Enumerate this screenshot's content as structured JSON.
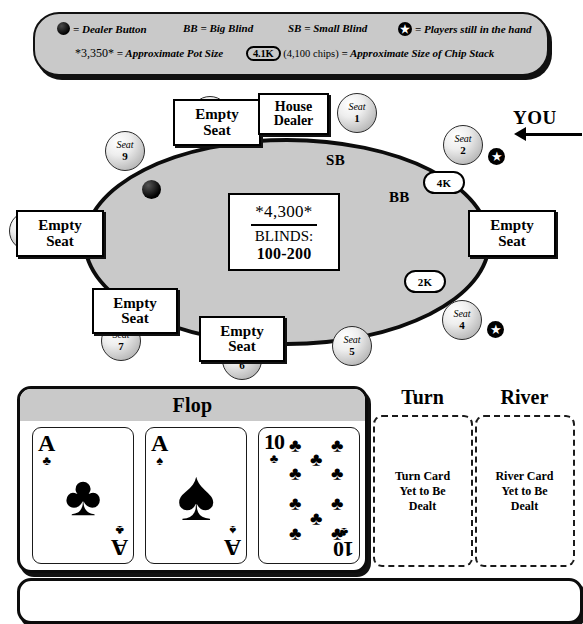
{
  "legend": {
    "dealer_button_icon": "dealer-button-dot",
    "dealer_button_text": "= Dealer Button",
    "bb_text": "BB = Big Blind",
    "sb_text": "SB = Small Blind",
    "star_icon": "star-in-circle-icon",
    "star_text": "= Players still in the hand",
    "pot_example": "*3,350*",
    "pot_example_text": "= Approximate Pot Size",
    "chip_pill": "4.1K",
    "chip_parenthetical": "(4,100 chips)",
    "chip_text": "= Approximate Size of Chip Stack"
  },
  "table": {
    "pot_amount": "*4,300*",
    "blinds_word": "BLINDS:",
    "blinds_value": "100-200",
    "sb_marker": "SB",
    "bb_marker": "BB",
    "you_label": "YOU",
    "seat_word": "Seat",
    "house_dealer": "House\nDealer",
    "house_dealer_line1": "House",
    "house_dealer_line2": "Dealer",
    "empty_seat_line1": "Empty",
    "empty_seat_line2": "Seat",
    "seats": [
      {
        "number": "1",
        "label": "Seat",
        "status": "open"
      },
      {
        "number": "2",
        "label": "Seat",
        "status": "in-hand",
        "stack": "4K"
      },
      {
        "number": "3",
        "label": "Seat",
        "status": "empty"
      },
      {
        "number": "4",
        "label": "Seat",
        "status": "in-hand",
        "stack": "2K"
      },
      {
        "number": "5",
        "label": "Seat",
        "status": "open"
      },
      {
        "number": "6",
        "label": "Seat",
        "status": "empty"
      },
      {
        "number": "7",
        "label": "Seat",
        "status": "empty"
      },
      {
        "number": "8",
        "label": "Seat",
        "status": "empty"
      },
      {
        "number": "9",
        "label": "Seat",
        "status": "open"
      }
    ],
    "stack_seat2": "4K",
    "stack_seat4": "2K"
  },
  "board": {
    "flop_title": "Flop",
    "turn_title": "Turn",
    "river_title": "River",
    "turn_placeholder": "Turn Card\nYet to Be\nDealt",
    "turn_placeholder_l1": "Turn Card",
    "turn_placeholder_l2": "Yet to Be",
    "turn_placeholder_l3": "Dealt",
    "river_placeholder_l1": "River Card",
    "river_placeholder_l2": "Yet to Be",
    "river_placeholder_l3": "Dealt",
    "flop_cards": [
      {
        "rank": "A",
        "suit": "clubs",
        "suit_glyph": "♣"
      },
      {
        "rank": "A",
        "suit": "spades",
        "suit_glyph": "♠"
      },
      {
        "rank": "10",
        "suit": "clubs",
        "suit_glyph": "♣"
      }
    ]
  },
  "colors": {
    "felt": "#c9c9c9",
    "outline": "#0c0c0c",
    "card_face": "#ffffff",
    "ink": "#000000"
  }
}
